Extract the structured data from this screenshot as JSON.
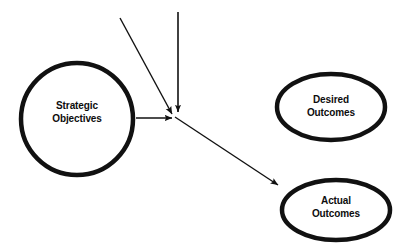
{
  "diagram": {
    "background_color": "#ffffff",
    "stroke_color": "#111111",
    "text_color": "#0d0d0d",
    "nodes": [
      {
        "id": "strategic-objectives",
        "shape": "circle",
        "label_line1": "Strategic",
        "label_line2": "Objectives",
        "cx": 77,
        "cy": 119,
        "r": 56,
        "stroke_width": 4.5
      },
      {
        "id": "desired-outcomes",
        "shape": "ellipse",
        "label_line1": "Desired",
        "label_line2": "Outcomes",
        "cx": 331,
        "cy": 107,
        "rx": 54,
        "ry": 33,
        "stroke_width": 4.5
      },
      {
        "id": "actual-outcomes",
        "shape": "ellipse",
        "label_line1": "Actual",
        "label_line2": "Outcomes",
        "cx": 336,
        "cy": 210,
        "rx": 54,
        "ry": 30,
        "stroke_width": 4.5
      }
    ],
    "arrows": [
      {
        "id": "arrow-diagonal-incoming",
        "from_x": 120,
        "from_y": 18,
        "to_x": 172,
        "to_y": 114,
        "stroke_width": 1.4
      },
      {
        "id": "arrow-vertical-incoming",
        "from_x": 178,
        "from_y": 12,
        "to_x": 178,
        "to_y": 112,
        "stroke_width": 1.6
      },
      {
        "id": "arrow-strategic-to-junction",
        "from_x": 136,
        "from_y": 118,
        "to_x": 172,
        "to_y": 118,
        "stroke_width": 1.4
      },
      {
        "id": "arrow-junction-to-actual",
        "from_x": 175,
        "from_y": 117,
        "to_x": 278,
        "to_y": 185,
        "stroke_width": 1.4
      }
    ]
  }
}
